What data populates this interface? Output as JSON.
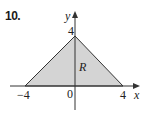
{
  "problem": {
    "number": "10."
  },
  "axes": {
    "x_label": "x",
    "y_label": "y"
  },
  "ticks": {
    "x_neg": "−4",
    "origin": "0",
    "x_pos": "4",
    "y_pos": "4"
  },
  "region": {
    "label": "R",
    "fill_color": "#d4d4d4",
    "edge_color": "#333333",
    "vertices": [
      [
        -4,
        0
      ],
      [
        0,
        4
      ],
      [
        4,
        0
      ]
    ]
  },
  "colors": {
    "axis": "#333333",
    "text": "#222222",
    "background": "#ffffff"
  }
}
